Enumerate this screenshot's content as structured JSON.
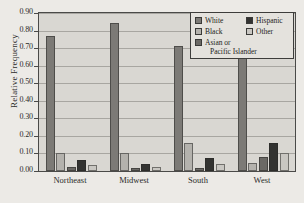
{
  "chart_data": {
    "type": "bar",
    "title": "",
    "xlabel": "",
    "ylabel": "Relative Frequency",
    "categories": [
      "Northeast",
      "Midwest",
      "South",
      "West"
    ],
    "ylim": [
      0.0,
      0.9
    ],
    "ytick_labels": [
      "0.90",
      "0.80",
      "0.70",
      "0.60",
      "0.50",
      "0.40",
      "0.30",
      "0.20",
      "0.10",
      "0.00"
    ],
    "ytick_values": [
      0.9,
      0.8,
      0.7,
      0.6,
      0.5,
      0.4,
      0.3,
      0.2,
      0.1,
      0.0
    ],
    "grid": "horizontal",
    "legend_position": "top-right",
    "series": [
      {
        "name": "White",
        "color": "#7c7a76",
        "values": [
          0.77,
          0.845,
          0.71,
          0.645
        ]
      },
      {
        "name": "Black",
        "color": "#b4b2ad",
        "values": [
          0.1,
          0.1,
          0.16,
          0.045
        ]
      },
      {
        "name": "Asian or Pacific Islander",
        "color": "#6b6965",
        "values": [
          0.025,
          0.02,
          0.02,
          0.08
        ]
      },
      {
        "name": "Hispanic",
        "color": "#333331",
        "values": [
          0.065,
          0.04,
          0.075,
          0.16
        ]
      },
      {
        "name": "Other",
        "color": "#c9c7c2",
        "values": [
          0.035,
          0.025,
          0.04,
          0.105
        ]
      }
    ]
  },
  "legend": {
    "entries": [
      {
        "label": "White",
        "label_line2": ""
      },
      {
        "label": "Black",
        "label_line2": ""
      },
      {
        "label": "Asian or",
        "label_line2": "Pacific Islander"
      },
      {
        "label": "Hispanic",
        "label_line2": ""
      },
      {
        "label": "Other",
        "label_line2": ""
      }
    ]
  },
  "colors": {
    "plot_background": "#d9d7d2",
    "page_background": "#eceae6",
    "axis": "#4a4a48",
    "gridline": "#a8a6a1",
    "legend_background": "#e4e2dd",
    "text": "#2b2b29"
  }
}
